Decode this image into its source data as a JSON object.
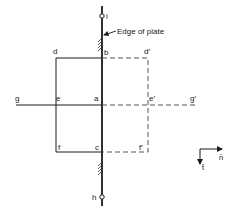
{
  "diagram": {
    "annotation": "Edge of plate",
    "points": {
      "a": "a",
      "b": "b",
      "c": "c",
      "d": "d",
      "e": "e",
      "f": "f",
      "g": "g",
      "d_prime": "d′",
      "e_prime": "e′",
      "f_prime": "f′",
      "g_prime": "g′",
      "h": "h",
      "i": "i"
    },
    "axes": {
      "normal": "n̄",
      "tangent": "t̄"
    },
    "colors": {
      "line": "#1a1a1a",
      "dashed": "#555555",
      "background": "#ffffff"
    }
  }
}
